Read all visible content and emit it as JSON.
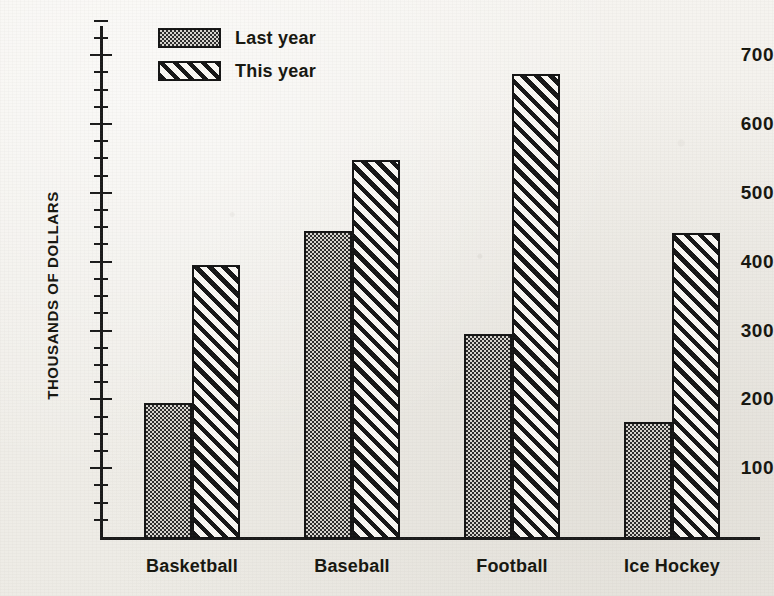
{
  "chart_data": {
    "type": "bar",
    "title": "",
    "xlabel": "",
    "ylabel": "THOUSANDS OF DOLLARS",
    "ylim": [
      0,
      725
    ],
    "grid": false,
    "legend_position": "top-left",
    "categories": [
      "Basketball",
      "Baseball",
      "Football",
      "Ice Hockey"
    ],
    "y_major_ticks": [
      100,
      200,
      300,
      400,
      500,
      600,
      700
    ],
    "y_tick_labels": [
      "100",
      "200",
      "300",
      "400",
      "500",
      "600",
      "700"
    ],
    "y_minor_tick_interval": 25,
    "series": [
      {
        "name": "Last year",
        "pattern": "stipple",
        "values": [
          195,
          445,
          295,
          167
        ]
      },
      {
        "name": "This year",
        "pattern": "diagonal-hatch",
        "values": [
          395,
          548,
          672,
          442
        ]
      }
    ]
  },
  "legend": {
    "entries": [
      {
        "label": "Last year",
        "pattern": "stipple"
      },
      {
        "label": "This year",
        "pattern": "diagonal-hatch"
      }
    ]
  },
  "colors": {
    "ink": "#141414",
    "paper": "#f4f2ee",
    "stipple_fill": "#9b9791",
    "hatch_fill": "#faf8f4"
  }
}
